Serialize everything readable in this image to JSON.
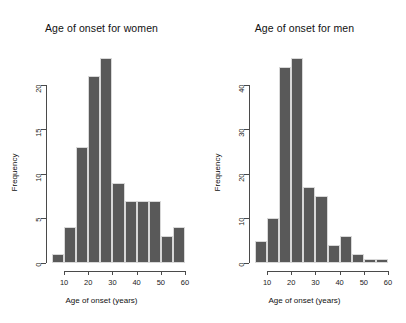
{
  "figure": {
    "background": "#ffffff",
    "bar_color": "#595959",
    "bar_border_color": "#d8d8d8",
    "axis_color": "#4a4a4a"
  },
  "chart_data": [
    {
      "type": "bar",
      "title": "Age of onset for women",
      "xlabel": "Age of onset (years)",
      "ylabel": "Frequency",
      "xlim": [
        5,
        60
      ],
      "ylim": [
        0,
        23
      ],
      "xticks": [
        10,
        20,
        30,
        40,
        50,
        60
      ],
      "xtick_labels": [
        "10",
        "20",
        "30",
        "40",
        "50",
        "60"
      ],
      "yticks": [
        0,
        5,
        10,
        15,
        20
      ],
      "ytick_labels": [
        "0",
        "5",
        "10",
        "15",
        "20"
      ],
      "grid": false,
      "legend": "none",
      "bin_width": 5,
      "bin_edges": [
        5,
        10,
        15,
        20,
        25,
        30,
        35,
        40,
        45,
        50,
        55,
        60
      ],
      "categories": [
        "5-10",
        "10-15",
        "15-20",
        "20-25",
        "25-30",
        "30-35",
        "35-40",
        "40-45",
        "45-50",
        "50-55",
        "55-60"
      ],
      "values": [
        1,
        4,
        13,
        21,
        23,
        9,
        7,
        7,
        7,
        3,
        4
      ]
    },
    {
      "type": "bar",
      "title": "Age of onset for men",
      "xlabel": "Age of onset (years)",
      "ylabel": "Frequency",
      "xlim": [
        5,
        60
      ],
      "ylim": [
        0,
        46
      ],
      "xticks": [
        10,
        20,
        30,
        40,
        50,
        60
      ],
      "xtick_labels": [
        "10",
        "20",
        "30",
        "40",
        "50",
        "60"
      ],
      "yticks": [
        0,
        10,
        20,
        30,
        40
      ],
      "ytick_labels": [
        "0",
        "10",
        "20",
        "30",
        "40"
      ],
      "grid": false,
      "legend": "none",
      "bin_width": 5,
      "bin_edges": [
        5,
        10,
        15,
        20,
        25,
        30,
        35,
        40,
        45,
        50,
        55,
        60
      ],
      "categories": [
        "5-10",
        "10-15",
        "15-20",
        "20-25",
        "25-30",
        "30-35",
        "35-40",
        "40-45",
        "45-50",
        "50-55",
        "55-60"
      ],
      "values": [
        5,
        10,
        44,
        46,
        17,
        15,
        4,
        6,
        2,
        1,
        1
      ]
    }
  ]
}
